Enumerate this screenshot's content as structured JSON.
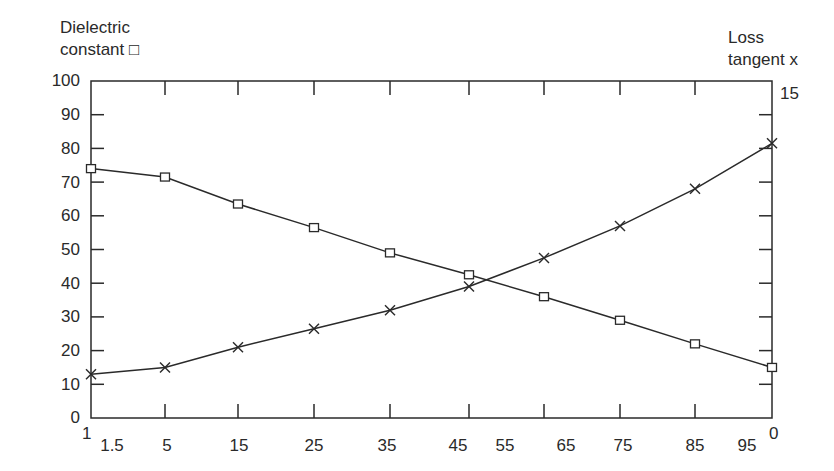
{
  "chart_data": {
    "type": "line",
    "title": "",
    "xlabel": "",
    "ylabel_left": "Dielectric constant □",
    "ylabel_left_lines": [
      "Dielectric",
      "constant □"
    ],
    "ylabel_right_lines": [
      "Loss",
      "tangent x"
    ],
    "ylabel_right": "Loss tangent x",
    "x_tick_labels": [
      "1",
      "1.5",
      "5",
      "15",
      "25",
      "35",
      "45",
      "55",
      "65",
      "75",
      "85",
      "95",
      "0"
    ],
    "x_positions": [
      0,
      1,
      2,
      3,
      4,
      5,
      6,
      7,
      8,
      9
    ],
    "y_left_ticks": [
      0,
      10,
      20,
      30,
      40,
      50,
      60,
      70,
      80,
      90,
      100
    ],
    "y_left_lim": [
      0,
      100
    ],
    "y_right_tick_labels": [
      "15"
    ],
    "y_right_lim": [
      0,
      15
    ],
    "grid": false,
    "legend": "axis labels (□ = dielectric constant, x = loss tangent)",
    "series": [
      {
        "name": "Dielectric constant",
        "marker": "square",
        "axis": "left",
        "values": [
          74,
          71.5,
          63.5,
          56.5,
          49,
          42.5,
          36,
          29,
          22,
          15
        ]
      },
      {
        "name": "Loss tangent",
        "marker": "x",
        "axis": "left-scale",
        "values": [
          13,
          15,
          21,
          26.5,
          32,
          39,
          47.5,
          57,
          68,
          81.5
        ]
      }
    ]
  }
}
